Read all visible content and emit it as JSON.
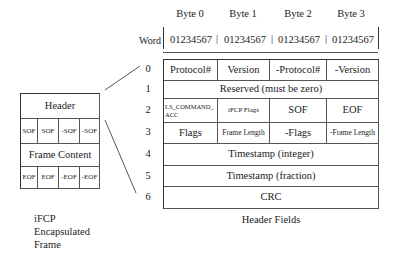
{
  "header_fields": {
    "byte_labels": [
      "Byte 0",
      "Byte 1",
      "Byte 2",
      "Byte 3"
    ],
    "word_label": "Word",
    "bit_labels": [
      "01234567",
      "01234567",
      "01234567",
      "01234567"
    ],
    "separator": "|",
    "row_numbers": [
      "0",
      "1",
      "2",
      "3",
      "4",
      "5",
      "6"
    ],
    "rows": [
      [
        "Protocol#",
        "Version",
        "-Protocol#",
        "-Version"
      ],
      [
        "Reserved (must be zero)"
      ],
      [
        "LS_COMMAND_ACC",
        "iFCP Flags",
        "SOF",
        "EOF"
      ],
      [
        "Flags",
        "Frame Length",
        "-Flags",
        "-Frame Length"
      ],
      [
        "Timestamp (integer)"
      ],
      [
        "Timestamp (fraction)"
      ],
      [
        "CRC"
      ]
    ],
    "caption": "Header Fields"
  },
  "frame": {
    "header": "Header",
    "sof_cells": [
      "SOF",
      "SOF",
      "-SOF",
      "-SOF"
    ],
    "content": "Frame Content",
    "eof_cells": [
      "EOF",
      "EOF",
      "-EOF",
      "-EOF"
    ],
    "caption_lines": [
      "iFCP",
      "Encapsulated",
      "Frame"
    ]
  }
}
